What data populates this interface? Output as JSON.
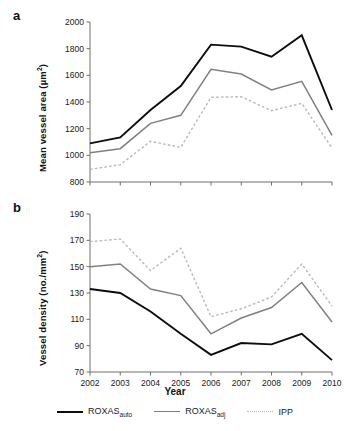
{
  "figure": {
    "xaxis_title": "Year",
    "panels": [
      {
        "letter": "a",
        "ylabel_text": "Mean vessel area (",
        "ylabel_unit": "µm",
        "ylabel_exp": "2",
        "ylabel_close": ")"
      },
      {
        "letter": "b",
        "ylabel_text": "Vessel density (no./mm",
        "ylabel_exp": "2",
        "ylabel_close": ")"
      }
    ]
  },
  "legend": {
    "position": "bottom-center",
    "items": [
      {
        "name": "ROXAS",
        "sub": "auto",
        "color": "#0d0d0d",
        "style": "solid"
      },
      {
        "name": "ROXAS",
        "sub": "adj",
        "color": "#808080",
        "style": "solid"
      },
      {
        "name": "IPP",
        "sub": "",
        "color": "#b9b9b9",
        "style": "dotted"
      }
    ]
  },
  "chart_data": [
    {
      "type": "line",
      "panel": "a",
      "title": "",
      "xlabel": "Year",
      "ylabel": "Mean vessel area (µm2)",
      "categories": [
        "2002",
        "2003",
        "2004",
        "2005",
        "2006",
        "2007",
        "2008",
        "2009",
        "2010"
      ],
      "x": [
        2002,
        2003,
        2004,
        2005,
        2006,
        2007,
        2008,
        2009,
        2010
      ],
      "ylim": [
        800,
        2000
      ],
      "yticks": [
        800,
        1000,
        1200,
        1400,
        1600,
        1800,
        2000
      ],
      "grid": false,
      "legend_position": "bottom",
      "series": [
        {
          "name": "ROXASauto",
          "color": "#0d0d0d",
          "style": "solid",
          "values": [
            1090,
            1135,
            1340,
            1520,
            1830,
            1815,
            1740,
            1900,
            1340
          ]
        },
        {
          "name": "ROXASadj",
          "color": "#808080",
          "style": "solid",
          "values": [
            1020,
            1050,
            1240,
            1300,
            1645,
            1610,
            1490,
            1555,
            1150
          ]
        },
        {
          "name": "IPP",
          "color": "#b9b9b9",
          "style": "dotted",
          "values": [
            895,
            930,
            1105,
            1060,
            1435,
            1440,
            1335,
            1390,
            1055
          ]
        }
      ]
    },
    {
      "type": "line",
      "panel": "b",
      "title": "",
      "xlabel": "Year",
      "ylabel": "Vessel density (no./mm2)",
      "categories": [
        "2002",
        "2003",
        "2004",
        "2005",
        "2006",
        "2007",
        "2008",
        "2009",
        "2010"
      ],
      "x": [
        2002,
        2003,
        2004,
        2005,
        2006,
        2007,
        2008,
        2009,
        2010
      ],
      "ylim": [
        70,
        190
      ],
      "yticks": [
        70,
        90,
        110,
        130,
        150,
        170,
        190
      ],
      "grid": false,
      "legend_position": "bottom",
      "series": [
        {
          "name": "ROXASauto",
          "color": "#0d0d0d",
          "style": "solid",
          "values": [
            133,
            130,
            116,
            99,
            83,
            92,
            91,
            99,
            79
          ]
        },
        {
          "name": "ROXASadj",
          "color": "#808080",
          "style": "solid",
          "values": [
            150,
            152,
            133,
            128,
            99,
            111,
            119,
            138,
            108
          ]
        },
        {
          "name": "IPP",
          "color": "#b9b9b9",
          "style": "dotted",
          "values": [
            169,
            171,
            147,
            164,
            112,
            118,
            127,
            152,
            120
          ]
        }
      ]
    }
  ]
}
